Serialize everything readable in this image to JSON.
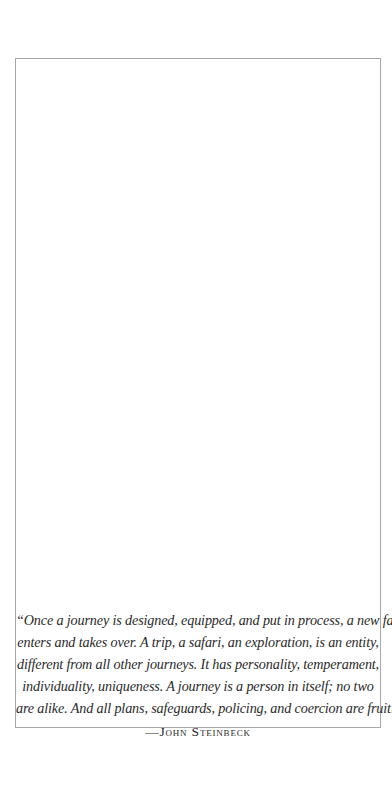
{
  "quote": {
    "lines": [
      "“Once a journey is designed, equipped, and put in process, a new factor",
      "enters and takes over. A trip, a safari, an exploration, is an entity,",
      "different from all other journeys. It has personality, temperament,",
      "individuality, uniqueness. A journey is a person in itself; no two",
      "are alike. And all plans, safeguards, policing, and coercion are fruitless.”"
    ],
    "attribution": "—John Steinbeck"
  },
  "colors": {
    "background": "#ffffff",
    "border": "#a8a8a8",
    "text": "#2a2a2a"
  }
}
